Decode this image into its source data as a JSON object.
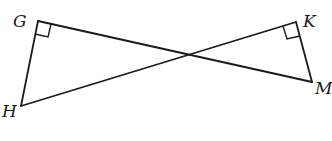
{
  "diagram": {
    "type": "geometry",
    "points": {
      "G": {
        "x": 38,
        "y": 21
      },
      "H": {
        "x": 21,
        "y": 106
      },
      "K": {
        "x": 296,
        "y": 22
      },
      "M": {
        "x": 312,
        "y": 82
      }
    },
    "segments": [
      {
        "from": "G",
        "to": "H"
      },
      {
        "from": "G",
        "to": "M"
      },
      {
        "from": "H",
        "to": "K"
      },
      {
        "from": "K",
        "to": "M"
      }
    ],
    "right_angles": [
      "G",
      "K"
    ],
    "labels": [
      {
        "id": "G",
        "text": "G",
        "x": 13,
        "y": 27
      },
      {
        "id": "H",
        "text": "H",
        "x": 2,
        "y": 117
      },
      {
        "id": "K",
        "text": "K",
        "x": 303,
        "y": 27
      },
      {
        "id": "M",
        "text": "M",
        "x": 315,
        "y": 94
      }
    ]
  }
}
